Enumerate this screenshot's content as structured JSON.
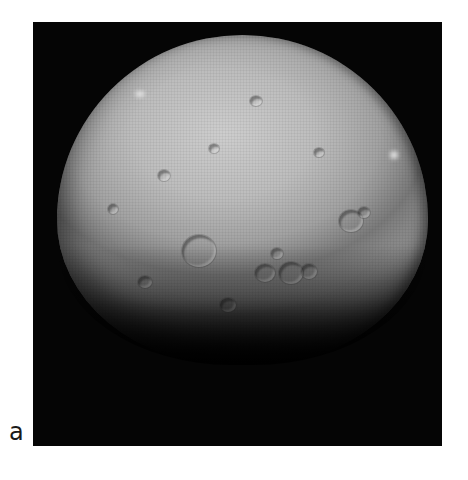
{
  "figure": {
    "panel_label": "a",
    "image": {
      "subject": "cratered dwarf planet (Ceres) photograph",
      "style": "grayscale",
      "background_color": "#050505",
      "surface_highlight_color": "#c6c6c6",
      "surface_shadow_color": "#333333"
    }
  }
}
